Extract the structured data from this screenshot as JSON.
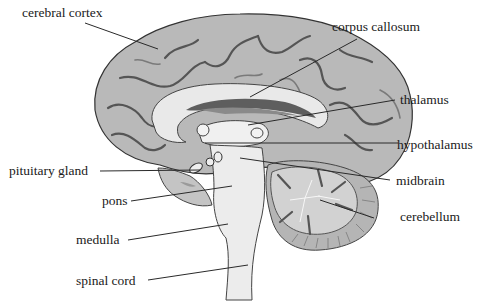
{
  "diagram": {
    "colors": {
      "background": "#ffffff",
      "cortex": "#b9b9b9",
      "cortex_dark": "#8f8f8f",
      "white_matter": "#e9e9e9",
      "ventricle": "#5e5e5e",
      "brainstem": "#ececec",
      "cerebellum": "#c9c9c9",
      "text": "#1a1a1a"
    },
    "labels": [
      {
        "id": "cerebral-cortex",
        "text": "cerebral cortex",
        "side": "left"
      },
      {
        "id": "corpus-callosum",
        "text": "corpus callosum",
        "side": "right"
      },
      {
        "id": "thalamus",
        "text": "thalamus",
        "side": "right"
      },
      {
        "id": "hypothalamus",
        "text": "hypothalamus",
        "side": "right"
      },
      {
        "id": "pituitary-gland",
        "text": "pituitary gland",
        "side": "left"
      },
      {
        "id": "midbrain",
        "text": "midbrain",
        "side": "right"
      },
      {
        "id": "pons",
        "text": "pons",
        "side": "left"
      },
      {
        "id": "cerebellum",
        "text": "cerebellum",
        "side": "right"
      },
      {
        "id": "medulla",
        "text": "medulla",
        "side": "left"
      },
      {
        "id": "spinal-cord",
        "text": "spinal cord",
        "side": "left"
      }
    ]
  }
}
